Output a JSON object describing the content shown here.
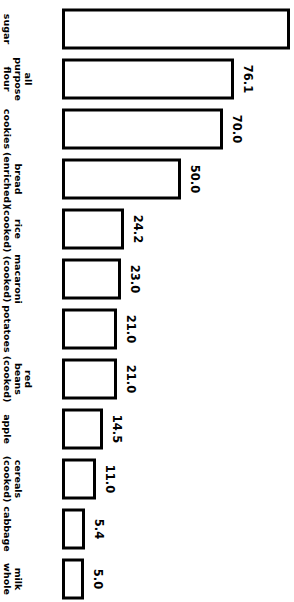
{
  "chart_data": {
    "type": "bar",
    "orientation": "vertical-rotated-90",
    "title": "",
    "subtitle": "",
    "xlabel": "",
    "ylabel": "",
    "grid": false,
    "legend": null,
    "ylim": [
      0,
      100
    ],
    "categories": [
      "sugar",
      "all purpose flour",
      "cookies",
      "bread (enriched)",
      "rice (cooked)",
      "macaroni (cooked)",
      "potatoes",
      "red beans (cooked)",
      "apple",
      "cereals (cooked)",
      "cabbage",
      "milk whole"
    ],
    "values": [
      100.0,
      76.1,
      70.0,
      50.0,
      24.2,
      23.0,
      21.0,
      21.0,
      14.5,
      11.0,
      5.4,
      5.0
    ],
    "bars": [
      {
        "category": "sugar",
        "label_lines": [
          "sugar"
        ],
        "value": 100.0,
        "value_label": "",
        "bar_px": 228
      },
      {
        "category": "all purpose flour",
        "label_lines": [
          "all",
          "purpose",
          "flour"
        ],
        "value": 76.1,
        "value_label": "76.1",
        "bar_px": 172
      },
      {
        "category": "cookies",
        "label_lines": [
          "cookies"
        ],
        "value": 70.0,
        "value_label": "70.0",
        "bar_px": 161
      },
      {
        "category": "bread (enriched)",
        "label_lines": [
          "bread",
          "(enriched)"
        ],
        "value": 50.0,
        "value_label": "50.0",
        "bar_px": 119
      },
      {
        "category": "rice (cooked)",
        "label_lines": [
          "rice",
          "(cooked)"
        ],
        "value": 24.2,
        "value_label": "24.2",
        "bar_px": 62
      },
      {
        "category": "macaroni (cooked)",
        "label_lines": [
          "macaroni",
          "(cooked)"
        ],
        "value": 23.0,
        "value_label": "23.0",
        "bar_px": 59
      },
      {
        "category": "potatoes",
        "label_lines": [
          "potatoes"
        ],
        "value": 21.0,
        "value_label": "21.0",
        "bar_px": 55
      },
      {
        "category": "red beans (cooked)",
        "label_lines": [
          "red",
          "beans",
          "(cooked)"
        ],
        "value": 21.0,
        "value_label": "21.0",
        "bar_px": 55
      },
      {
        "category": "apple",
        "label_lines": [
          "apple"
        ],
        "value": 14.5,
        "value_label": "14.5",
        "bar_px": 41
      },
      {
        "category": "cereals (cooked)",
        "label_lines": [
          "cereals",
          "(cooked)"
        ],
        "value": 11.0,
        "value_label": "11.0",
        "bar_px": 34
      },
      {
        "category": "cabbage",
        "label_lines": [
          "cabbage"
        ],
        "value": 5.4,
        "value_label": "5.4",
        "bar_px": 23
      },
      {
        "category": "milk whole",
        "label_lines": [
          "milk",
          "whole"
        ],
        "value": 5.0,
        "value_label": "5.0",
        "bar_px": 22
      }
    ]
  },
  "style": {
    "bar_fill": "#ffffff",
    "bar_stroke": "#000000",
    "text_color": "#000000",
    "background": "#ffffff"
  }
}
